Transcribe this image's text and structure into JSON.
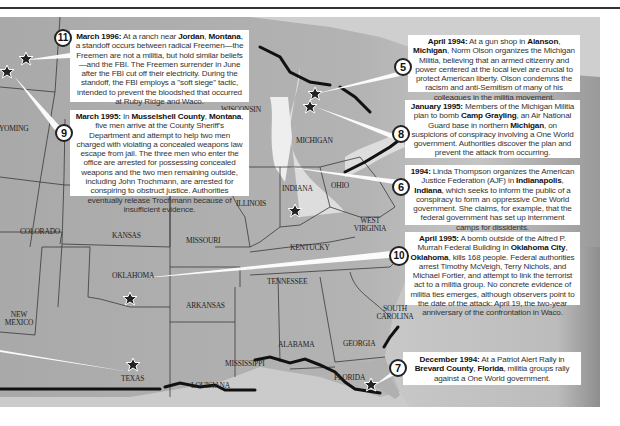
{
  "map": {
    "title": "Militia activity map",
    "state_labels": [
      {
        "id": "wyoming",
        "text": "WYOMING",
        "x": -8,
        "y": 125
      },
      {
        "id": "colorado",
        "text": "COLORADO",
        "x": 20,
        "y": 228
      },
      {
        "id": "kansas",
        "text": "KANSAS",
        "x": 112,
        "y": 232
      },
      {
        "id": "oklahoma",
        "text": "OKLAHOMA",
        "x": 112,
        "y": 272
      },
      {
        "id": "new-mexico",
        "text": "NEW MEXICO",
        "x": 6,
        "y": 311
      },
      {
        "id": "texas",
        "text": "TEXAS",
        "x": 121,
        "y": 375
      },
      {
        "id": "missouri",
        "text": "MISSOURI",
        "x": 186,
        "y": 237
      },
      {
        "id": "arkansas",
        "text": "ARKANSAS",
        "x": 186,
        "y": 302
      },
      {
        "id": "louisiana",
        "text": "LOUISIANA",
        "x": 191,
        "y": 382
      },
      {
        "id": "mississippi",
        "text": "MISSISSIPPI",
        "x": 225,
        "y": 360
      },
      {
        "id": "illinois",
        "text": "ILLINOIS",
        "x": 236,
        "y": 200
      },
      {
        "id": "wisconsin",
        "text": "WISCONSIN",
        "x": 221,
        "y": 106
      },
      {
        "id": "michigan",
        "text": "MICHIGAN",
        "x": 296,
        "y": 137
      },
      {
        "id": "indiana",
        "text": "INDIANA",
        "x": 282,
        "y": 185
      },
      {
        "id": "ohio",
        "text": "OHIO",
        "x": 331,
        "y": 182
      },
      {
        "id": "kentucky",
        "text": "KENTUCKY",
        "x": 290,
        "y": 244
      },
      {
        "id": "west-virginia",
        "text": "WEST VIRGINIA",
        "x": 353,
        "y": 217
      },
      {
        "id": "tennessee",
        "text": "TENNESSEE",
        "x": 267,
        "y": 278
      },
      {
        "id": "alabama",
        "text": "ALABAMA",
        "x": 278,
        "y": 341
      },
      {
        "id": "georgia",
        "text": "GEORGIA",
        "x": 343,
        "y": 340
      },
      {
        "id": "south-carolina",
        "text": "SOUTH CAROLINA",
        "x": 375,
        "y": 305
      },
      {
        "id": "florida",
        "text": "FLORIDA",
        "x": 334,
        "y": 374
      }
    ]
  },
  "callouts": [
    {
      "number": "11",
      "date": "March 1996:",
      "text_parts": [
        "At a ranch near ",
        "Jordan",
        ", ",
        "Montana",
        ", a standoff occurs between radical Freemen—the Freemen are not a militia, but hold similar beliefs—and the FBI.  The Freemen surrender in June after the FBI cut off their electricity. During the standoff, the FBI employs a \"soft siege\" tactic, intended to prevent the bloodshed that occurred at Ruby Ridge and Waco."
      ]
    },
    {
      "number": "9",
      "date": "March 1995:",
      "text_parts": [
        "In ",
        "Musselshell County",
        ", ",
        "Montana",
        ", five men arrive at the County Sheriff's Department and attempt to help two men charged with violating a concealed weapons law escape from jail.  The three men who enter the office are arrested for possessing concealed weapons and the two men remaining outside, including John Trochmann, are arrested for conspiring to obstruct justice.  Authorities eventually release Trochmann because of insufficient evidence."
      ]
    },
    {
      "number": "5",
      "date": "April 1994:",
      "text_parts": [
        "At a gun shop in ",
        "Alanson",
        ", ",
        "Michigan",
        ", Norm Olson organizes the Michigan Militia, believing that an armed citizenry and power centered at the local level are crucial to protect American liberty. Olson condemns the racism and anti-Semitism of many of his colleagues in the militia movement."
      ]
    },
    {
      "number": "8",
      "date": "January 1995:",
      "text_parts": [
        "Members of the Michigan Militia plan to bomb ",
        "Camp Grayling",
        ", an Air National Guard base in northern ",
        "Michigan",
        ", on suspicions of conspiracy involving a One World government.  Authorities discover the plan and prevent the attack from occurring."
      ]
    },
    {
      "number": "6",
      "date": "1994:",
      "text_parts": [
        "Linda Thompson organizes the American Justice Federation (AJF) in ",
        "Indianapolis",
        ", ",
        "Indiana",
        ", which seeks to inform the public of a conspiracy to form an oppressive One World government. She claims, for example, that the federal government has set up internment camps for dissidents."
      ]
    },
    {
      "number": "10",
      "date": "April 1995:",
      "text_parts": [
        "A bomb outside of the Alfred P. Murrah Federal Building in ",
        "Oklahoma City",
        ", ",
        "Oklahoma",
        ", kills 168 people.  Federal authorities arrest Timothy McVeigh, Terry Nichols, and Michael Fortier, and attempt to link the terrorist act to a militia group.  No concrete evidence of militia ties emerges, although observers point to the date of the attack: April 19, the two-year anniversary of the confrontation in Waco."
      ]
    },
    {
      "number": "7",
      "date": "December 1994:",
      "text_parts": [
        "At a Patriot Alert Rally in ",
        "Brevard County",
        ", ",
        "Florida",
        ", militia groups rally against a One World government."
      ]
    }
  ],
  "colors": {
    "land": "#b0b0b0",
    "water": "#d6d6d6",
    "border": "#3a3a3a",
    "callout_bg": "#ffffff",
    "marker": "#222222"
  }
}
